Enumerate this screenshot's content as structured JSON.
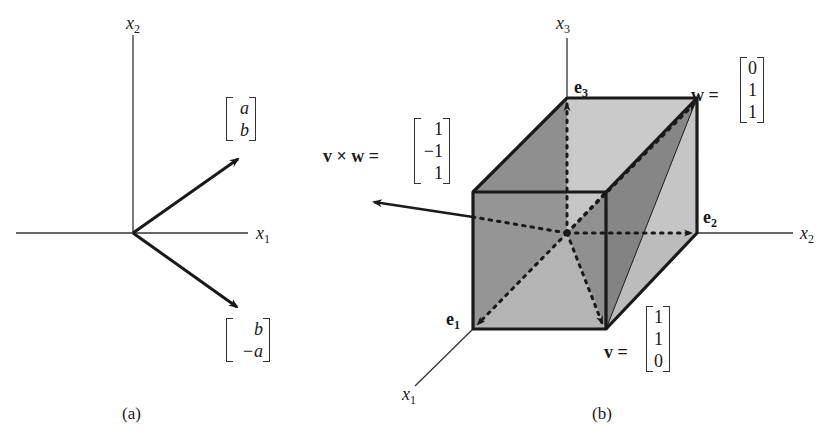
{
  "panel_a": {
    "caption": "(a)",
    "axis_x1": "x",
    "axis_x1_sub": "1",
    "axis_x2": "x",
    "axis_x2_sub": "2",
    "vector_up": {
      "rows": [
        "a",
        "b"
      ]
    },
    "vector_down": {
      "rows": [
        "b",
        "−a"
      ]
    }
  },
  "panel_b": {
    "caption": "(b)",
    "axis_x1": "x",
    "axis_x1_sub": "1",
    "axis_x2": "x",
    "axis_x2_sub": "2",
    "axis_x3": "x",
    "axis_x3_sub": "3",
    "e1": "e",
    "e1_sub": "1",
    "e2": "e",
    "e2_sub": "2",
    "e3": "e",
    "e3_sub": "3",
    "w_label": "w =",
    "w_vector": [
      "0",
      "1",
      "1"
    ],
    "v_label": "v =",
    "v_vector": [
      "1",
      "1",
      "0"
    ],
    "cross_label": "v × w =",
    "cross_vector": [
      "1",
      "−1",
      "1"
    ]
  },
  "colors": {
    "ink": "#1a1a1a",
    "face_dark": "#8a8a8a",
    "face_mid": "#a8a8a8",
    "face_light": "#c8c8c8",
    "face_darkest": "#6e6e6e"
  }
}
